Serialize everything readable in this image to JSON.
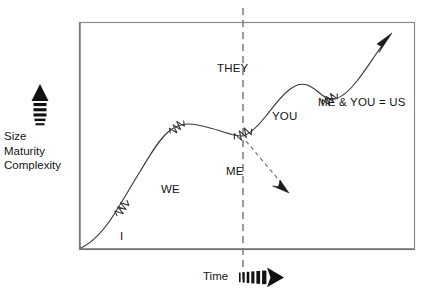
{
  "diagram": {
    "frame": {
      "x": 79,
      "y": 22,
      "width": 336,
      "height": 228,
      "border_color": "#8a8a8a",
      "background": "#ffffff"
    },
    "y_axis": {
      "arrow_icon": "up-arrow-dashed-tail",
      "label_lines": [
        "Size",
        "Maturity",
        "Complexity"
      ]
    },
    "x_axis": {
      "label": "Time",
      "arrow_icon": "right-arrow-dashed-tail"
    },
    "divider": {
      "label": "THEY",
      "style": "dashed-vertical",
      "color": "#7a7a7a",
      "x": 243
    },
    "stage_labels": [
      {
        "name": "i-label",
        "text": "I",
        "x": 120,
        "y": 230
      },
      {
        "name": "we-label",
        "text": "WE",
        "x": 161,
        "y": 183
      },
      {
        "name": "me-label",
        "text": "ME",
        "x": 226,
        "y": 165
      },
      {
        "name": "you-label",
        "text": "YOU",
        "x": 272,
        "y": 110
      },
      {
        "name": "me-you-us-label",
        "text": "ME & YOU = US",
        "x": 318,
        "y": 96
      }
    ],
    "curve": {
      "color": "#3a3a3a",
      "stroke_width": 1,
      "end_arrow_icon": "arrowhead-up-right",
      "break_marks": 4,
      "break_mark_icon": "zigzag-break-mark"
    },
    "decline_arrow": {
      "name": "decline-arrow",
      "style": "dashed",
      "direction": "down-right",
      "color": "#6e6e6e",
      "arrow_icon": "arrowhead-down-right"
    },
    "colors": {
      "ink": "#141414",
      "curve": "#3a3a3a",
      "frame": "#8a8a8a",
      "dash": "#7a7a7a"
    }
  }
}
